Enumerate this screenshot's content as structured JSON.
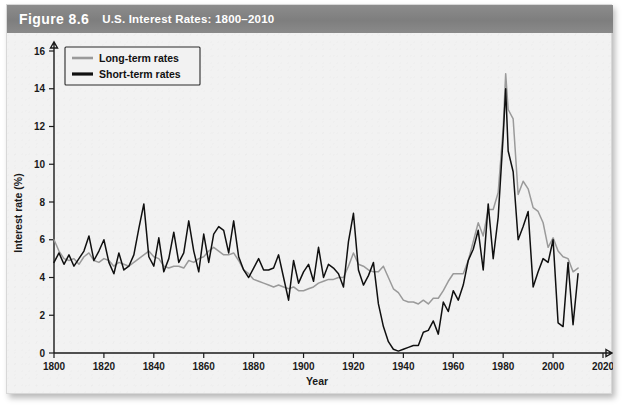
{
  "figure": {
    "number_label": "Figure 8.6",
    "title": "U.S. Interest Rates: 1800–2010"
  },
  "legend": {
    "position": "top-left-inside",
    "items": [
      {
        "label": "Long-term rates",
        "color": "#9a9a9a"
      },
      {
        "label": "Short-term rates",
        "color": "#101010"
      }
    ]
  },
  "axes": {
    "x_title": "Year",
    "y_title": "Interest rate (%)",
    "x_ticks": [
      "1800",
      "1820",
      "1840",
      "1860",
      "1880",
      "1900",
      "1920",
      "1940",
      "1960",
      "1980",
      "2000",
      "2020"
    ],
    "y_ticks": [
      "0",
      "2",
      "4",
      "6",
      "8",
      "10",
      "12",
      "14",
      "16"
    ]
  },
  "chart_data": {
    "type": "line",
    "title": "U.S. Interest Rates: 1800–2010",
    "xlabel": "Year",
    "ylabel": "Interest rate (%)",
    "xlim": [
      1800,
      2020
    ],
    "ylim": [
      0,
      16
    ],
    "xtick_step": 20,
    "ytick_step": 2,
    "grid": false,
    "legend_position": "upper left",
    "x": [
      1800,
      1802,
      1804,
      1806,
      1808,
      1810,
      1812,
      1814,
      1816,
      1818,
      1820,
      1822,
      1824,
      1826,
      1828,
      1830,
      1832,
      1834,
      1836,
      1838,
      1840,
      1842,
      1844,
      1846,
      1848,
      1850,
      1852,
      1854,
      1856,
      1858,
      1860,
      1862,
      1864,
      1866,
      1868,
      1870,
      1872,
      1874,
      1876,
      1878,
      1880,
      1882,
      1884,
      1886,
      1888,
      1890,
      1892,
      1894,
      1896,
      1898,
      1900,
      1902,
      1904,
      1906,
      1908,
      1910,
      1912,
      1914,
      1916,
      1918,
      1920,
      1922,
      1924,
      1926,
      1928,
      1930,
      1932,
      1934,
      1936,
      1938,
      1940,
      1942,
      1944,
      1946,
      1948,
      1950,
      1952,
      1954,
      1956,
      1958,
      1960,
      1962,
      1964,
      1966,
      1968,
      1970,
      1972,
      1974,
      1976,
      1978,
      1980,
      1981,
      1982,
      1984,
      1986,
      1988,
      1990,
      1992,
      1994,
      1996,
      1998,
      2000,
      2002,
      2004,
      2006,
      2008,
      2010
    ],
    "series": [
      {
        "name": "Long-term rates",
        "color": "#9a9a9a",
        "values": [
          6.0,
          5.4,
          5.0,
          4.9,
          5.0,
          4.7,
          5.1,
          5.3,
          4.9,
          4.8,
          5.0,
          4.9,
          4.6,
          4.8,
          4.7,
          4.6,
          4.8,
          5.0,
          5.2,
          5.4,
          5.1,
          5.0,
          4.6,
          4.5,
          4.6,
          4.6,
          4.5,
          4.9,
          4.8,
          5.0,
          5.1,
          5.4,
          5.6,
          5.4,
          5.2,
          5.2,
          5.3,
          4.9,
          4.4,
          4.2,
          3.9,
          3.8,
          3.7,
          3.6,
          3.5,
          3.6,
          3.5,
          3.4,
          3.5,
          3.3,
          3.3,
          3.4,
          3.5,
          3.7,
          3.8,
          3.9,
          3.9,
          4.0,
          4.0,
          4.6,
          5.3,
          4.7,
          4.6,
          4.4,
          4.3,
          4.3,
          4.6,
          4.0,
          3.4,
          3.2,
          2.8,
          2.7,
          2.7,
          2.6,
          2.8,
          2.6,
          2.9,
          2.9,
          3.3,
          3.8,
          4.2,
          4.2,
          4.2,
          4.9,
          5.9,
          6.9,
          6.2,
          7.6,
          7.6,
          8.5,
          11.9,
          14.8,
          12.9,
          12.4,
          8.4,
          9.1,
          8.7,
          7.7,
          7.5,
          6.9,
          5.6,
          6.1,
          5.4,
          5.1,
          5.0,
          4.3,
          4.5
        ]
      },
      {
        "name": "Short-term rates",
        "color": "#101010",
        "values": [
          4.8,
          5.3,
          4.7,
          5.2,
          4.6,
          5.0,
          5.4,
          6.2,
          4.9,
          5.4,
          6.0,
          4.8,
          4.2,
          5.3,
          4.4,
          4.6,
          5.2,
          6.6,
          7.9,
          5.1,
          4.6,
          6.1,
          4.3,
          5.0,
          6.4,
          4.8,
          5.3,
          7.0,
          5.4,
          4.3,
          6.3,
          4.8,
          6.3,
          6.7,
          6.5,
          5.3,
          7.0,
          5.1,
          4.4,
          4.0,
          4.5,
          5.0,
          4.4,
          4.4,
          4.5,
          5.2,
          4.0,
          2.8,
          4.9,
          3.7,
          4.3,
          4.7,
          3.8,
          5.6,
          4.0,
          4.7,
          4.5,
          4.2,
          3.5,
          5.9,
          7.4,
          4.4,
          3.6,
          4.1,
          4.8,
          2.6,
          1.4,
          0.6,
          0.2,
          0.1,
          0.2,
          0.3,
          0.4,
          0.4,
          1.1,
          1.2,
          1.7,
          1.0,
          2.7,
          2.2,
          3.3,
          2.8,
          3.6,
          4.9,
          5.5,
          6.5,
          4.4,
          7.9,
          5.0,
          7.2,
          11.5,
          14.0,
          10.7,
          9.6,
          6.0,
          6.7,
          7.5,
          3.5,
          4.3,
          5.0,
          4.8,
          6.0,
          1.6,
          1.4,
          4.8,
          1.5,
          4.2
        ]
      }
    ]
  }
}
